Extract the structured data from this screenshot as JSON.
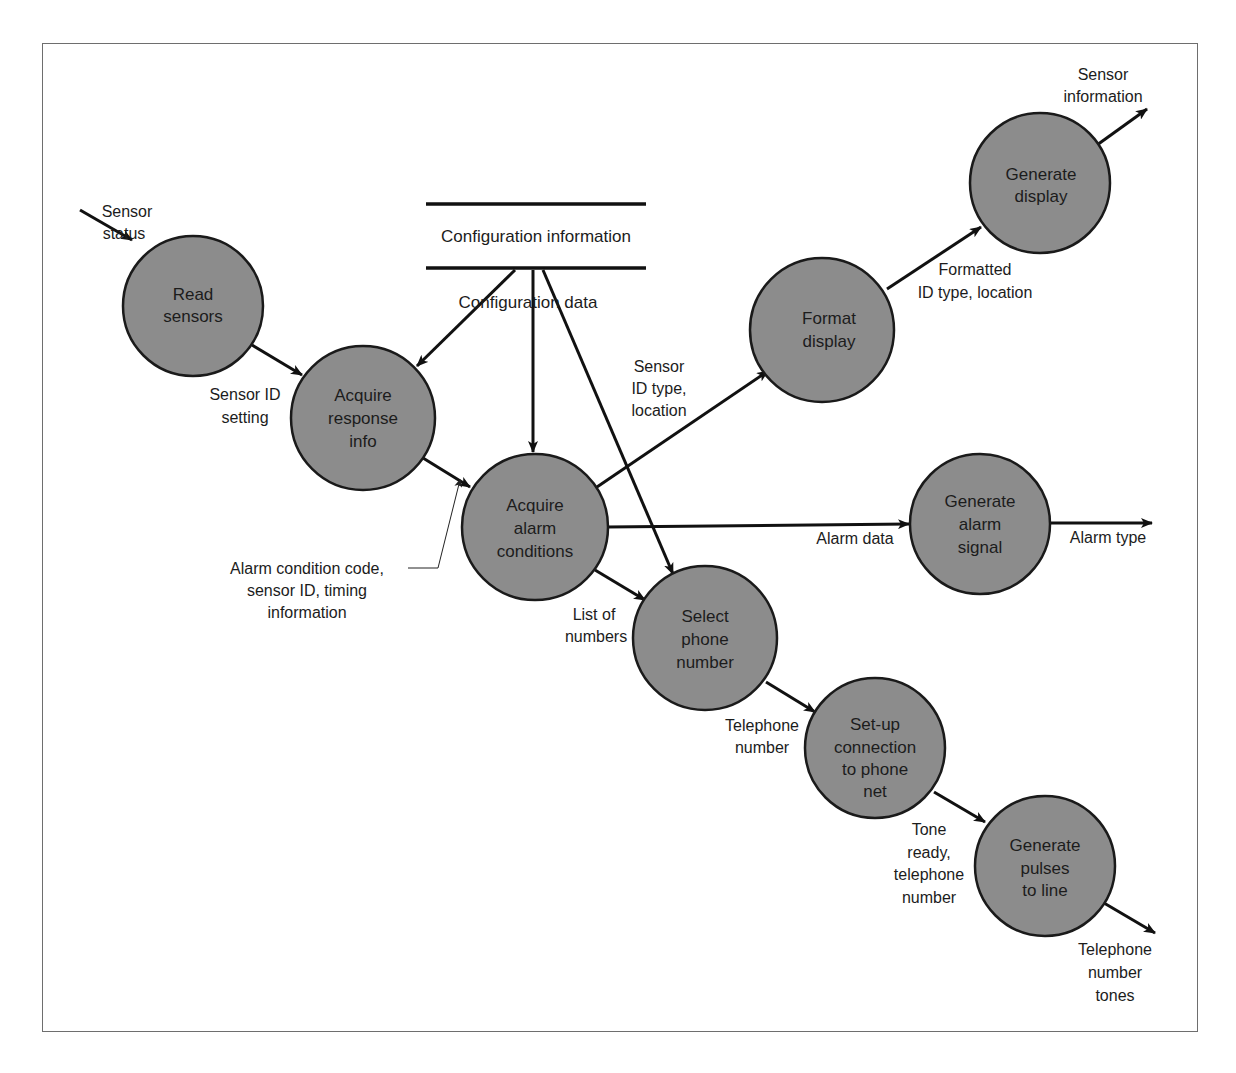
{
  "diagram": {
    "type": "data-flow-diagram",
    "data_store": {
      "label": "Configuration information",
      "flow_label": "Configuration data"
    },
    "processes": [
      {
        "id": "read_sensors",
        "lines": [
          "Read",
          "sensors"
        ]
      },
      {
        "id": "acquire_response",
        "lines": [
          "Acquire",
          "response",
          "info"
        ]
      },
      {
        "id": "acquire_alarm",
        "lines": [
          "Acquire",
          "alarm",
          "conditions"
        ]
      },
      {
        "id": "format_display",
        "lines": [
          "Format",
          "display"
        ]
      },
      {
        "id": "generate_display",
        "lines": [
          "Generate",
          "display"
        ]
      },
      {
        "id": "generate_alarm",
        "lines": [
          "Generate",
          "alarm",
          "signal"
        ]
      },
      {
        "id": "select_phone",
        "lines": [
          "Select",
          "phone",
          "number"
        ]
      },
      {
        "id": "setup_connection",
        "lines": [
          "Set-up",
          "connection",
          "to phone",
          "net"
        ]
      },
      {
        "id": "generate_pulses",
        "lines": [
          "Generate",
          "pulses",
          "to line"
        ]
      }
    ],
    "flows": [
      {
        "from": "external",
        "to": "read_sensors",
        "lines": [
          "Sensor",
          "status"
        ]
      },
      {
        "from": "read_sensors",
        "to": "acquire_response",
        "lines": [
          "Sensor ID",
          "setting"
        ]
      },
      {
        "from": "configuration_store",
        "to": "acquire_response",
        "lines": []
      },
      {
        "from": "configuration_store",
        "to": "acquire_alarm",
        "lines": []
      },
      {
        "from": "configuration_store",
        "to": "select_phone",
        "lines": []
      },
      {
        "from": "acquire_response",
        "to": "acquire_alarm",
        "lines": [
          "Alarm condition code,",
          "sensor ID, timing",
          "information"
        ]
      },
      {
        "from": "acquire_alarm",
        "to": "format_display",
        "lines": [
          "Sensor",
          "ID type,",
          "location"
        ]
      },
      {
        "from": "format_display",
        "to": "generate_display",
        "lines": [
          "Formatted",
          "ID type, location"
        ]
      },
      {
        "from": "generate_display",
        "to": "external",
        "lines": [
          "Sensor",
          "information"
        ]
      },
      {
        "from": "acquire_alarm",
        "to": "generate_alarm",
        "lines": [
          "Alarm data"
        ]
      },
      {
        "from": "generate_alarm",
        "to": "external",
        "lines": [
          "Alarm type"
        ]
      },
      {
        "from": "acquire_alarm",
        "to": "select_phone",
        "lines": [
          "List of",
          "numbers"
        ]
      },
      {
        "from": "select_phone",
        "to": "setup_connection",
        "lines": [
          "Telephone",
          "number"
        ]
      },
      {
        "from": "setup_connection",
        "to": "generate_pulses",
        "lines": [
          "Tone",
          "ready,",
          "telephone",
          "number"
        ]
      },
      {
        "from": "generate_pulses",
        "to": "external",
        "lines": [
          "Telephone",
          "number",
          "tones"
        ]
      }
    ]
  }
}
